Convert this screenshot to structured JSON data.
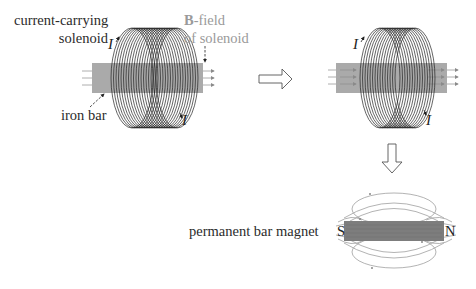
{
  "diagram": {
    "stage1": {
      "label_solenoid_line1": "current-carrying",
      "label_solenoid_line2": "solenoid",
      "label_iron_bar": "iron bar",
      "label_bfield_bold": "B",
      "label_bfield_rest": "-field",
      "label_bfield_line2": "of solenoid",
      "current_label_top": "I",
      "current_label_bottom": "I"
    },
    "stage2": {
      "current_label_top": "I",
      "current_label_bottom": "I"
    },
    "stage3": {
      "label_magnet": "permanent bar magnet",
      "pole_south": "S",
      "pole_north": "N"
    },
    "arrows": {
      "right_arrow": "process-arrow-right",
      "down_arrow": "process-arrow-down"
    },
    "colors": {
      "coil": "#222222",
      "iron_bar": "#aaaaaa",
      "magnet": "#7d7d7d",
      "field_lines": "#9a9a9a",
      "text": "#2b2b2b",
      "text_muted": "#9a9a9a"
    }
  }
}
